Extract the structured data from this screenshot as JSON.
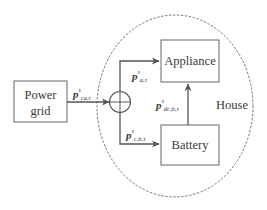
{
  "diagram": {
    "container": {
      "label": "House",
      "style": "dashed-ellipse"
    },
    "nodes": [
      {
        "id": "power-grid",
        "label_line1": "Power",
        "label_line2": "grid"
      },
      {
        "id": "appliance",
        "label": "Appliance"
      },
      {
        "id": "battery",
        "label": "Battery"
      },
      {
        "id": "junction",
        "symbol": "⊕"
      }
    ],
    "edges": [
      {
        "from": "power-grid",
        "to": "junction",
        "var": "p",
        "sup": "s",
        "sub": "ca,τ"
      },
      {
        "from": "junction",
        "to": "appliance",
        "var": "p",
        "sup": "s",
        "sub": "a,τ"
      },
      {
        "from": "junction",
        "to": "battery",
        "var": "p",
        "sup": "s",
        "sub": "c,b,τ"
      },
      {
        "from": "battery",
        "to": "appliance",
        "var": "p",
        "sup": "s",
        "sub": "dc,b,τ"
      }
    ]
  },
  "colors": {
    "line": "#555555",
    "dash": "#777777",
    "text": "#3a3a3a"
  }
}
